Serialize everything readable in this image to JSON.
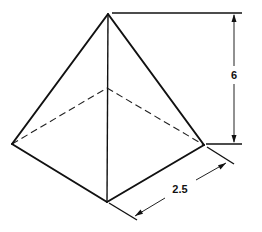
{
  "figure": {
    "type": "pyramid-dimension-drawing",
    "dimensions": {
      "height": {
        "label": "6"
      },
      "base_side": {
        "label": "2.5"
      }
    },
    "vertices": {
      "apex": [
        108,
        14
      ],
      "left": [
        12,
        144
      ],
      "front": [
        107,
        202
      ],
      "right": [
        204,
        145
      ],
      "back": [
        107,
        88
      ]
    },
    "colors": {
      "line": "#111111",
      "background": "#ffffff"
    }
  }
}
